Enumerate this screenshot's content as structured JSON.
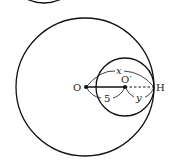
{
  "diagram": {
    "labels": {
      "center_large": "O",
      "center_small": "O′",
      "tangent_point": "H",
      "segment_oo": "5",
      "arc_oh": "x",
      "arc_o_h": "y"
    },
    "colors": {
      "stroke": "#111111",
      "background": "#ffffff"
    }
  }
}
